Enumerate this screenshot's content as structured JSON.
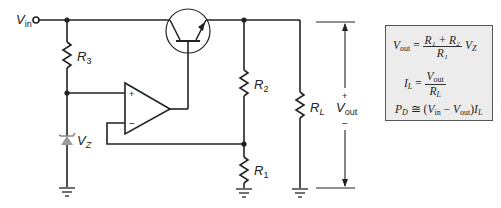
{
  "diagram": {
    "type": "series voltage regulator circuit",
    "colors": {
      "wire": "#222222",
      "zener_fill": "#9a9a9a",
      "box_fill": "#ececec",
      "box_border": "#555555"
    },
    "labels": {
      "vin": {
        "main": "V",
        "sub": "in"
      },
      "r3": {
        "main": "R",
        "sub": "3"
      },
      "vz": {
        "main": "V",
        "sub": "Z"
      },
      "r2": {
        "main": "R",
        "sub": "2"
      },
      "r1": {
        "main": "R",
        "sub": "1"
      },
      "rl": {
        "main": "R",
        "sub": "L"
      },
      "vout": {
        "main": "V",
        "sub": "out",
        "plus": "+",
        "minus": "−"
      },
      "opamp_plus": "+",
      "opamp_minus": "−"
    },
    "components": [
      "Vin terminal",
      "R3",
      "Zener diode VZ",
      "Op-amp",
      "NPN pass transistor",
      "R2",
      "R1",
      "RL",
      "Vout arrow",
      "Ground symbols"
    ]
  },
  "equations": {
    "vout": {
      "lhs_main": "V",
      "lhs_sub": "out",
      "eq": " = ",
      "num": "R₁ + R₂",
      "den": "R₁",
      "tail_main": "V",
      "tail_sub": "Z"
    },
    "il": {
      "lhs_main": "I",
      "lhs_sub": "L",
      "eq": " = ",
      "num_main": "V",
      "num_sub": "out",
      "den_main": "R",
      "den_sub": "L"
    },
    "pd": {
      "lhs_main": "P",
      "lhs_sub": "D",
      "eq": " ≅ (",
      "v1_main": "V",
      "v1_sub": "in",
      "minus": " − ",
      "v2_main": "V",
      "v2_sub": "out",
      "close": ")",
      "i_main": "I",
      "i_sub": "L"
    }
  }
}
